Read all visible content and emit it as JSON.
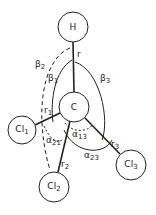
{
  "diagram": {
    "colors": {
      "stroke": "#222222",
      "background": "#ffffff"
    },
    "atoms": [
      {
        "id": "H",
        "label": "H",
        "sub": "",
        "cx": 73,
        "cy": 27,
        "r": 15
      },
      {
        "id": "C",
        "label": "C",
        "sub": "",
        "cx": 74,
        "cy": 107,
        "r": 15
      },
      {
        "id": "Cl1",
        "label": "Cl",
        "sub": "1",
        "cx": 22,
        "cy": 130,
        "r": 14
      },
      {
        "id": "Cl2",
        "label": "Cl",
        "sub": "2",
        "cx": 54,
        "cy": 187,
        "r": 15
      },
      {
        "id": "Cl3",
        "label": "Cl",
        "sub": "3",
        "cx": 131,
        "cy": 165,
        "r": 15
      }
    ],
    "bonds": [
      {
        "from": "C",
        "to": "H",
        "label": "r"
      },
      {
        "from": "C",
        "to": "Cl1",
        "label": "r1"
      },
      {
        "from": "C",
        "to": "Cl2",
        "label": "r2"
      },
      {
        "from": "C",
        "to": "Cl3",
        "label": "r3"
      }
    ],
    "labels": {
      "r": {
        "base": "r",
        "sub": ""
      },
      "r1": {
        "base": "r",
        "sub": "1"
      },
      "r2": {
        "base": "r",
        "sub": "2"
      },
      "r3": {
        "base": "r",
        "sub": "3"
      },
      "beta1": {
        "base": "β",
        "sub": "1"
      },
      "beta2": {
        "base": "β",
        "sub": "2"
      },
      "beta3": {
        "base": "β",
        "sub": "3"
      },
      "alpha21": {
        "base": "α",
        "sub": "21"
      },
      "alpha13": {
        "base": "α",
        "sub": "13"
      },
      "alpha23": {
        "base": "α",
        "sub": "23"
      }
    }
  }
}
